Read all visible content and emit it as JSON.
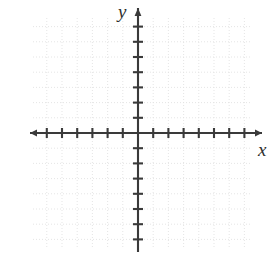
{
  "figure": {
    "kind": "blank-cartesian-coordinate-plane",
    "background_color": "#ffffff"
  },
  "labels": {
    "x_axis": "x",
    "y_axis": "y"
  },
  "icons": {
    "x_axis_right_arrow": "arrow-right-icon",
    "x_axis_left_arrow": "arrow-left-icon",
    "y_axis_up_arrow": "arrow-up-icon"
  },
  "chart_data": {
    "type": "scatter",
    "title": "",
    "subtitle": "",
    "xlabel": "x",
    "ylabel": "y",
    "series": [
      {
        "name": "",
        "x": [],
        "y": []
      }
    ],
    "x": [],
    "values": [],
    "categories": [],
    "annotations": [],
    "legend": {
      "entries": [],
      "position": "none"
    },
    "grid": {
      "visible": true,
      "style": "dotted",
      "color": "#e2e2e2",
      "spacing_px": 15.2,
      "columns": 15,
      "rows": 15
    },
    "axes": {
      "origin_px": {
        "x": 138,
        "y": 133
      },
      "unit_px": 15.2,
      "xlim": [
        -7,
        8
      ],
      "ylim": [
        -7,
        7
      ],
      "x_ticks": [
        -7,
        -6,
        -5,
        -4,
        -3,
        -2,
        -1,
        1,
        2,
        3,
        4,
        5,
        6,
        7,
        8
      ],
      "y_ticks": [
        -7,
        -6,
        -5,
        -4,
        -3,
        -2,
        -1,
        1,
        2,
        3,
        4,
        5,
        6,
        7
      ],
      "x_tick_labels": [],
      "y_tick_labels": [],
      "tick_half_length_px": 5,
      "axis_color": "#3a3a3a",
      "axis_width_px": 2.1,
      "x_axis_span_px": {
        "start": 30,
        "end": 262
      },
      "y_axis_span_px": {
        "start": 8,
        "end": 252
      },
      "arrowheads": [
        "x-right",
        "x-left",
        "y-up"
      ]
    }
  },
  "colors": {
    "axis": "#3a3a3a",
    "grid": "#e2e2e2",
    "label": "#2e2e2e",
    "background": "#ffffff"
  }
}
